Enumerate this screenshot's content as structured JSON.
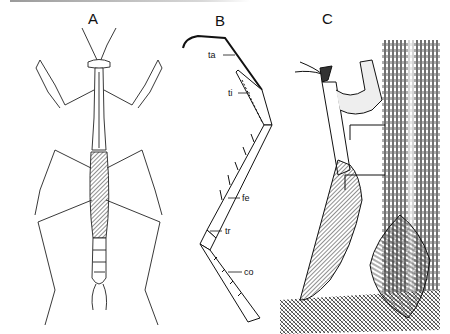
{
  "figure": {
    "panels": [
      {
        "id": "A",
        "label": "A",
        "description": "Dorsal view of whole mantis"
      },
      {
        "id": "B",
        "label": "B",
        "description": "Raptorial foreleg with labeled segments"
      },
      {
        "id": "C",
        "label": "C",
        "description": "Mantis on tree bark beside ootheca (egg case)"
      }
    ],
    "leg_labels": [
      {
        "abbr": "ta",
        "meaning": "tarsus"
      },
      {
        "abbr": "ti",
        "meaning": "tibia"
      },
      {
        "abbr": "fe",
        "meaning": "femur"
      },
      {
        "abbr": "tr",
        "meaning": "trochanter"
      },
      {
        "abbr": "co",
        "meaning": "coxa"
      }
    ]
  },
  "colors": {
    "ink": "#111111",
    "paper": "#ffffff",
    "bar": "#9a9a9a"
  }
}
